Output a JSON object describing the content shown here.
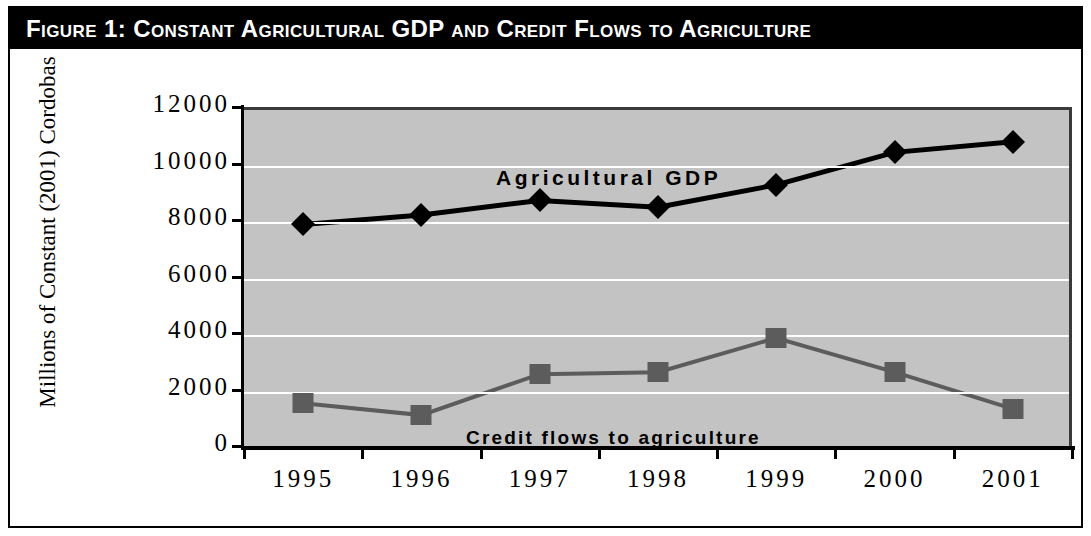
{
  "figure": {
    "title": "Figure 1:  Constant Agricultural GDP and Credit Flows to Agriculture"
  },
  "chart_data": {
    "type": "line",
    "title": "Figure 1:  Constant Agricultural GDP and Credit Flows to Agriculture",
    "xlabel": "",
    "ylabel": "Millions of Constant (2001) Cordobas",
    "categories": [
      "1995",
      "1996",
      "1997",
      "1998",
      "1999",
      "2000",
      "2001"
    ],
    "ylim": [
      0,
      12000
    ],
    "ytick_labels": [
      "12000",
      "10000",
      "8000",
      "6000",
      "4000",
      "2000",
      "0"
    ],
    "ytick_values": [
      12000,
      10000,
      8000,
      6000,
      4000,
      2000,
      0
    ],
    "grid": true,
    "legend_position": "inline-annotations",
    "plot_background": "#c3c3c3",
    "gridline_color": "#ffffff",
    "series": [
      {
        "name": "Agricultural GDP",
        "marker": "diamond",
        "color": "#000000",
        "values": [
          7950,
          8280,
          8800,
          8560,
          9350,
          10500,
          10880
        ]
      },
      {
        "name": "Credit flows to agriculture",
        "marker": "square",
        "color": "#5c5c5c",
        "values": [
          1620,
          1200,
          2650,
          2720,
          3930,
          2720,
          1420
        ]
      }
    ],
    "annotations": [
      {
        "text": "Agricultural GDP",
        "series": "Agricultural GDP"
      },
      {
        "text": "Credit flows to agriculture",
        "series": "Credit flows to agriculture"
      }
    ]
  }
}
